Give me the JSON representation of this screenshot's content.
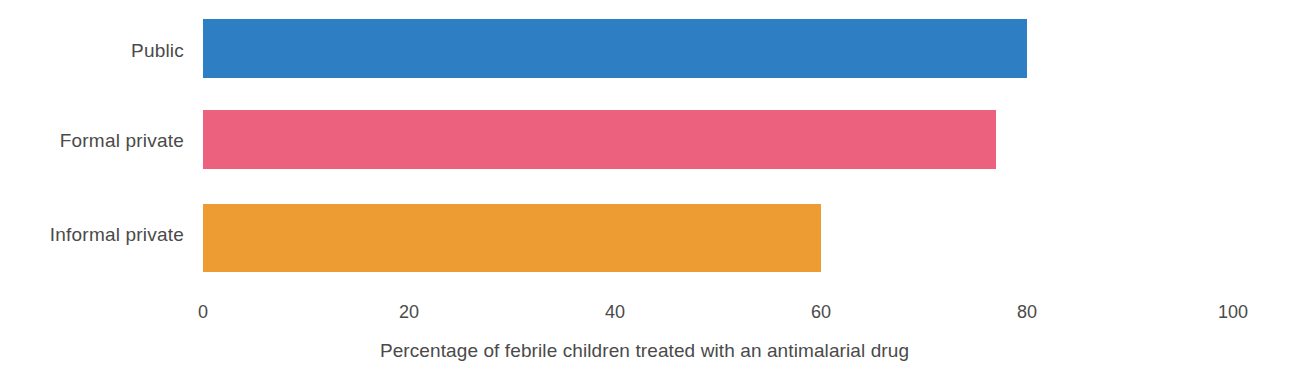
{
  "chart_data": {
    "type": "bar",
    "orientation": "horizontal",
    "title": "",
    "subtitle": "",
    "xlabel": "Percentage of febrile children treated with an antimalarial drug",
    "ylabel": "",
    "categories": [
      "Public",
      "Formal private",
      "Informal private"
    ],
    "values": [
      80,
      77,
      60
    ],
    "colors": [
      "#2e7ec4",
      "#ec627e",
      "#ec9c33"
    ],
    "xlim": [
      0,
      100
    ],
    "xticks": [
      0,
      20,
      40,
      60,
      80,
      100
    ],
    "xtick_labels": [
      "0",
      "20",
      "40",
      "60",
      "80",
      "100"
    ],
    "grid": false,
    "legend": false,
    "legend_position": "none",
    "annotations": [],
    "bars": [
      {
        "category": "Public",
        "value": 80,
        "color": "#2e7ec4"
      },
      {
        "category": "Formal private",
        "value": 77,
        "color": "#ec627e"
      },
      {
        "category": "Informal private",
        "value": 60,
        "color": "#ec9c33"
      }
    ]
  },
  "text_color": "#4a4a4a",
  "background": "#ffffff"
}
